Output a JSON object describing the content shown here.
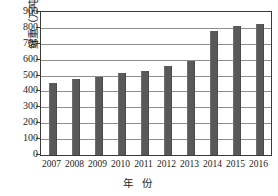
{
  "chart_data": {
    "type": "bar",
    "title": "",
    "subtitle": "",
    "xlabel": "年 份",
    "ylabel": "鲜重（万吨）",
    "categories": [
      "2007",
      "2008",
      "2009",
      "2010",
      "2011",
      "2012",
      "2013",
      "2014",
      "2015",
      "2016"
    ],
    "values": [
      455,
      478,
      490,
      515,
      530,
      563,
      592,
      780,
      810,
      825
    ],
    "series": [
      {
        "name": "鲜重",
        "values": [
          455,
          478,
          490,
          515,
          530,
          563,
          592,
          780,
          810,
          825
        ]
      }
    ],
    "ylim": [
      0,
      900
    ],
    "ytick_step": 100,
    "ytick_labels": [
      "0",
      "100",
      "200",
      "300",
      "400",
      "500",
      "600",
      "700",
      "800",
      "900"
    ],
    "xtick_labels": [
      "2007",
      "2008",
      "2009",
      "2010",
      "2011",
      "2012",
      "2013",
      "2014",
      "2015",
      "2016"
    ],
    "grid": true,
    "grid_axis": "y",
    "legend": false,
    "legend_position": "none",
    "bar_color": "#595959",
    "grid_color": "#8d8d8d",
    "frame_color": "#3a3a3a",
    "background_color": "#ffffff",
    "annotations": []
  }
}
